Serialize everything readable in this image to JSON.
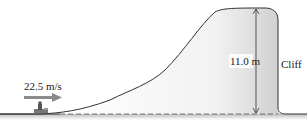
{
  "diagram": {
    "velocity_label": "22.5 m/s",
    "height_label": "11.0 m",
    "cliff_label": "Cliff",
    "colors": {
      "line": "#333333",
      "arrow": "#8a8a8a",
      "shade": "#cfcfcf"
    }
  }
}
